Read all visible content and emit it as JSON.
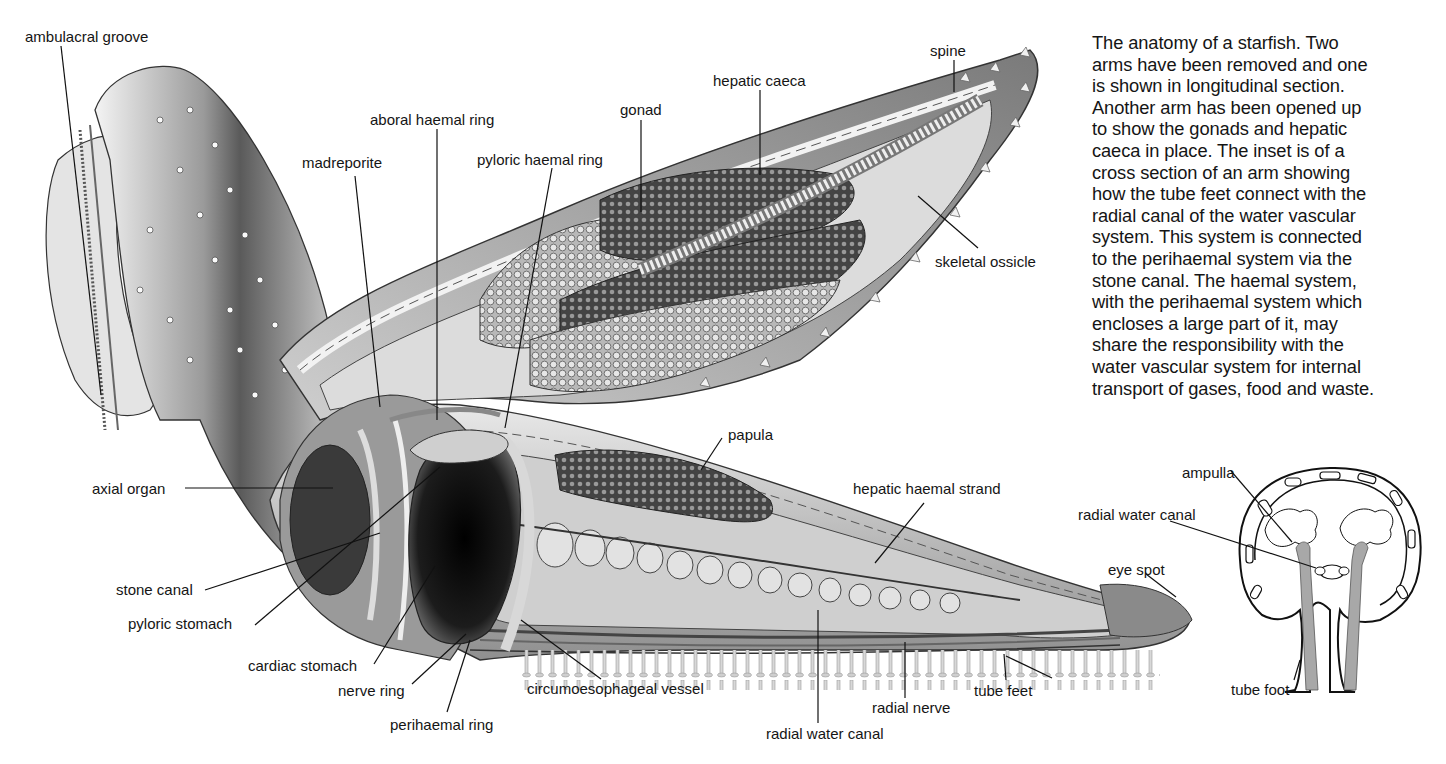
{
  "figure": {
    "caption_lines": [
      "The anatomy of a starfish. Two",
      "arms have been removed and one",
      "is shown in longitudinal section.",
      "Another arm has been opened up",
      "to show the gonads and hepatic",
      "caeca in place. The inset is of a",
      "cross section of an arm showing",
      "how the tube feet connect with the",
      "radial canal of the water vascular",
      "system. This system is connected",
      "to the perihaemal system via the",
      "stone canal. The haemal system,",
      "with the perihaemal system which",
      "encloses a large part of it, may",
      "share the responsibility with the",
      "water vascular system for internal",
      "transport of gases, food and waste."
    ]
  },
  "main_labels": {
    "ambulacral_groove": "ambulacral groove",
    "madreporite": "madreporite",
    "aboral_haemal_ring": "aboral haemal ring",
    "pyloric_haemal_ring": "pyloric haemal ring",
    "gonad": "gonad",
    "hepatic_caeca": "hepatic caeca",
    "spine": "spine",
    "skeletal_ossicle": "skeletal ossicle",
    "papula": "papula",
    "hepatic_haemal_strand": "hepatic haemal strand",
    "axial_organ": "axial organ",
    "stone_canal": "stone canal",
    "pyloric_stomach": "pyloric stomach",
    "cardiac_stomach": "cardiac stomach",
    "nerve_ring": "nerve ring",
    "perihaemal_ring": "perihaemal ring",
    "circumoesophageal_vessel": "circumoesophageal vessel",
    "radial_water_canal": "radial water canal",
    "radial_nerve": "radial nerve",
    "tube_feet": "tube feet",
    "eye_spot": "eye spot"
  },
  "inset_labels": {
    "ampulla": "ampulla",
    "radial_water_canal": "radial water canal",
    "tube_foot": "tube foot"
  },
  "colors": {
    "background": "#ffffff",
    "ink": "#151515",
    "body_dark": "#3a3a3a",
    "body_mid": "#8a8a8a",
    "body_light": "#d6d6d6",
    "inset_fill": "#a8a8a8"
  }
}
